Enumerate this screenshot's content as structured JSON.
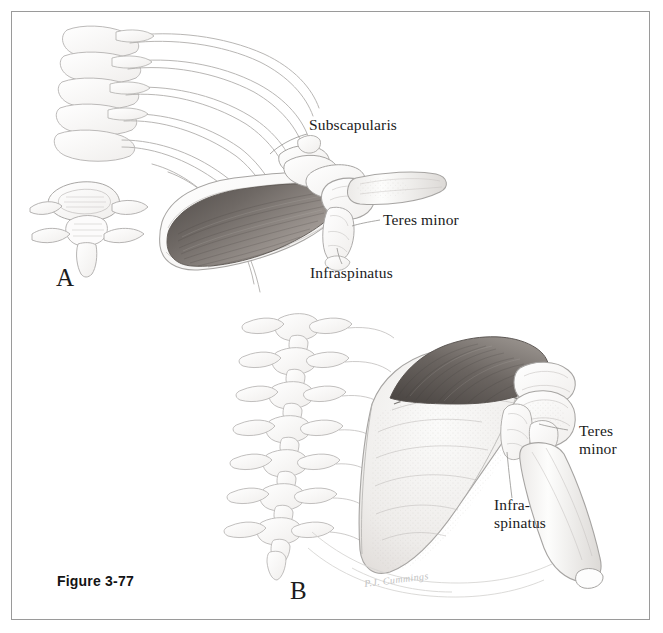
{
  "figure": {
    "caption": "Figure 3-77",
    "artist_signature": "P.J. Cummings",
    "panels": [
      {
        "letter": "A",
        "view": "anterior view of scapula, ribs and vertebra",
        "labels": [
          {
            "id": "subscapularis",
            "text": "Subscapularis"
          },
          {
            "id": "teres-minor",
            "text": "Teres minor"
          },
          {
            "id": "infraspinatus",
            "text": "Infraspinatus"
          }
        ]
      },
      {
        "letter": "B",
        "view": "posterior view of scapula, vertebral column and humerus",
        "labels": [
          {
            "id": "teres-minor",
            "text": "Teres\nminor"
          },
          {
            "id": "infraspinatus",
            "text": "Infra-\nspinatus"
          }
        ]
      }
    ]
  },
  "colors": {
    "page_background": "#ffffff",
    "border": "#9a9a9a",
    "bone_outline": "#a9a7a5",
    "bone_fill": "#fcfcfb",
    "muscle_dark": "#5f5a57",
    "muscle_mid": "#8a8480",
    "muscle_light": "#b9b3ae",
    "label_text": "#1b1b1b",
    "caption_text": "#141414",
    "leader_line": "#8e8c8a",
    "signature": "#c2c2c2"
  }
}
